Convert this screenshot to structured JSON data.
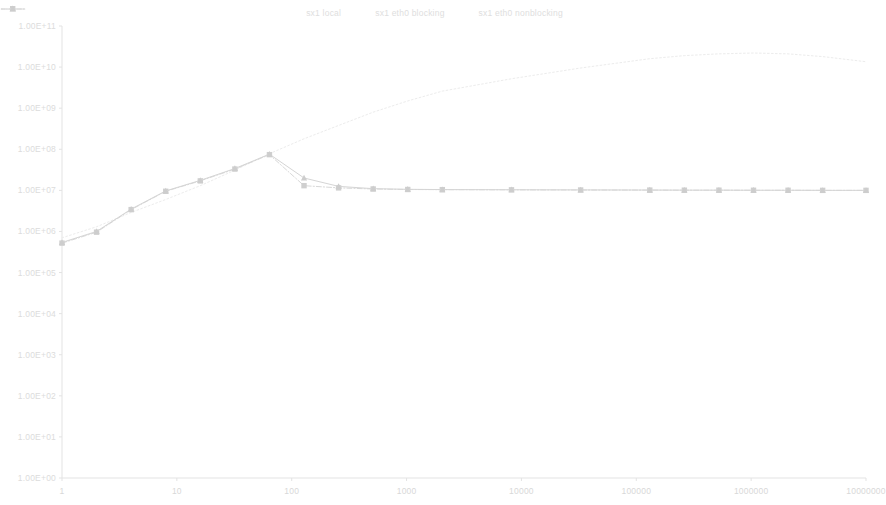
{
  "chart_data": {
    "type": "line",
    "title": "",
    "subtitle": "",
    "xlabel": "",
    "ylabel": "",
    "xscale": "log",
    "yscale": "log",
    "xlim": [
      1,
      10000000
    ],
    "ylim": [
      1,
      100000000000
    ],
    "grid": false,
    "legend_position": "top-center",
    "x_tick_labels": [
      "1",
      "10",
      "100",
      "1000",
      "10000",
      "100000",
      "1000000",
      "10000000"
    ],
    "x_ticks": [
      1,
      10,
      100,
      1000,
      10000,
      100000,
      1000000,
      10000000
    ],
    "y_tick_labels": [
      "1.00E+11",
      "1.00E+10",
      "1.00E+09",
      "1.00E+08",
      "1.00E+07",
      "1.00E+06",
      "1.00E+05",
      "1.00E+04",
      "1.00E+03",
      "1.00E+02",
      "1.00E+01",
      "1.00E+00"
    ],
    "y_ticks": [
      100000000000,
      10000000000,
      1000000000,
      100000000,
      10000000,
      1000000,
      100000,
      10000,
      1000,
      100,
      10,
      1
    ],
    "x": [
      1,
      2,
      4,
      8,
      16,
      32,
      64,
      128,
      256,
      512,
      1024,
      2048,
      8192,
      32768,
      131072,
      262144,
      524288,
      1048576,
      2097152,
      4194304,
      10000000
    ],
    "series": [
      {
        "name": "sx1 local",
        "color": "#ececec",
        "line_style": "dotted",
        "marker": "none",
        "values": [
          700000,
          1300000,
          2900000,
          6000000,
          13000000,
          31000000,
          78000000,
          180000000,
          380000000,
          800000000,
          1500000000,
          2600000000,
          5200000000,
          9500000000,
          16000000000.0,
          19000000000.0,
          21000000000.0,
          22000000000.0,
          21000000000.0,
          18000000000.0,
          13500000000.0
        ]
      },
      {
        "name": "sx1 eth0 blocking",
        "color": "#d8d8d8",
        "line_style": "dash-dot",
        "marker": "square",
        "values": [
          520000,
          960000,
          3400000,
          9500000,
          17000000,
          33000000,
          74000000,
          13000000,
          11500000,
          10800000,
          10500000,
          10400000,
          10300000,
          10200000,
          10150000,
          10100000,
          10100000,
          10050000,
          10050000,
          10000000,
          10000000
        ]
      },
      {
        "name": "sx1 eth0 nonblocking",
        "color": "#d5d5d5",
        "line_style": "solid",
        "marker": "triangle",
        "values": [
          540000,
          1000000,
          3500000,
          9700000,
          17500000,
          34000000,
          76000000,
          20000000,
          12500000,
          11000000,
          10600000,
          10450000,
          10350000,
          10250000,
          10180000,
          10120000,
          10110000,
          10060000,
          10060000,
          10010000,
          10010000
        ]
      }
    ]
  },
  "legend": {
    "items": [
      {
        "label": "sx1 local",
        "key": "dotted-line-key",
        "color": "#e8e8e8"
      },
      {
        "label": "sx1 eth0 blocking",
        "key": "square-marker-key",
        "color": "#d6d6d6"
      },
      {
        "label": "sx1 eth0 nonblocking",
        "key": "triangle-marker-key",
        "color": "#d3d3d3"
      }
    ]
  },
  "axes": {
    "axis_line_color": "#e3e3e3",
    "tick_label_color": "#dcdcdc"
  },
  "plot_area": {
    "left": 62,
    "right": 866,
    "top": 26,
    "bottom": 478
  }
}
